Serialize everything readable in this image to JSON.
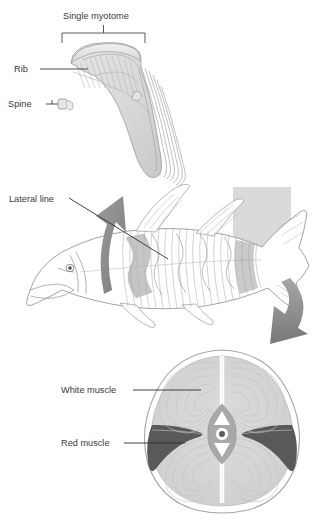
{
  "figure": {
    "background_color": "#ffffff",
    "line_color": "#8c8c8c",
    "label_color": "#3b3b3b",
    "white_muscle_color": "#d2d2d2",
    "red_muscle_color": "#595959",
    "arrow_color": "#8e8e8e",
    "plane_marker_color": "#cfcfcf"
  },
  "labels": {
    "single_myotome": "Single myotome",
    "rib": "Rib",
    "spine": "Spine",
    "lateral_line": "Lateral line",
    "white_muscle": "White muscle",
    "red_muscle": "Red muscle"
  },
  "panels": {
    "myotome_detail": {
      "name": "Single myotome detail",
      "bracket_label": "Single myotome",
      "callouts": [
        "Rib",
        "Spine"
      ]
    },
    "fish_lateral": {
      "name": "Lateral view of fish with myotome blocks",
      "callouts": [
        "Lateral line"
      ],
      "arrows": [
        "myotome-up-arrow",
        "cross-section-down-arrow"
      ]
    },
    "cross_section": {
      "name": "Transverse cross-section of fish trunk",
      "callouts": [
        "White muscle",
        "Red muscle"
      ]
    }
  }
}
